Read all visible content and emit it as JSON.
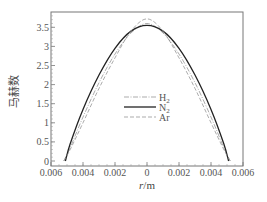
{
  "chart_data": {
    "type": "line",
    "title": "",
    "xlabel": "r/m",
    "xlabel_italic_part": "r",
    "xlabel_unit_part": "/m",
    "ylabel": "马赫数",
    "xlim": [
      -0.006,
      0.006
    ],
    "ylim": [
      0,
      3.85
    ],
    "x_tick_labels": [
      "0.006",
      "0.004",
      "0.002",
      "0",
      "0.002",
      "0.004",
      "0.006"
    ],
    "x_ticks": [
      -0.006,
      -0.004,
      -0.002,
      0,
      0.002,
      0.004,
      0.006
    ],
    "y_tick_labels": [
      "0",
      "0.5",
      "1",
      "1.5",
      "2",
      "2.5",
      "3",
      "3.5"
    ],
    "y_ticks": [
      0,
      0.5,
      1,
      1.5,
      2,
      2.5,
      3,
      3.5
    ],
    "grid": false,
    "legend_position": "center",
    "series": [
      {
        "name": "H2",
        "label_main": "H",
        "label_sub": "2",
        "style": "dash-dot",
        "color": "#888888",
        "x": [
          -0.0052,
          -0.0048,
          -0.004,
          -0.003,
          -0.002,
          -0.001,
          0,
          0.001,
          0.002,
          0.003,
          0.004,
          0.0048,
          0.0052
        ],
        "y": [
          0,
          0.35,
          1.15,
          2.05,
          2.8,
          3.35,
          3.6,
          3.35,
          2.8,
          2.05,
          1.15,
          0.35,
          0
        ]
      },
      {
        "name": "N2",
        "label_main": "N",
        "label_sub": "2",
        "style": "solid",
        "color": "#222222",
        "x": [
          -0.0051,
          -0.0048,
          -0.004,
          -0.003,
          -0.002,
          -0.001,
          0,
          0.001,
          0.002,
          0.003,
          0.004,
          0.0048,
          0.0051
        ],
        "y": [
          0,
          0.45,
          1.35,
          2.25,
          2.95,
          3.4,
          3.55,
          3.4,
          2.95,
          2.25,
          1.35,
          0.45,
          0
        ]
      },
      {
        "name": "Ar",
        "label_main": "Ar",
        "label_sub": "",
        "style": "dashed",
        "color": "#888888",
        "x": [
          -0.0052,
          -0.0048,
          -0.004,
          -0.003,
          -0.002,
          -0.001,
          0,
          0.001,
          0.002,
          0.003,
          0.004,
          0.0048,
          0.0052
        ],
        "y": [
          0,
          0.3,
          1.0,
          1.9,
          2.7,
          3.4,
          3.72,
          3.4,
          2.7,
          1.9,
          1.0,
          0.3,
          0
        ]
      }
    ]
  }
}
